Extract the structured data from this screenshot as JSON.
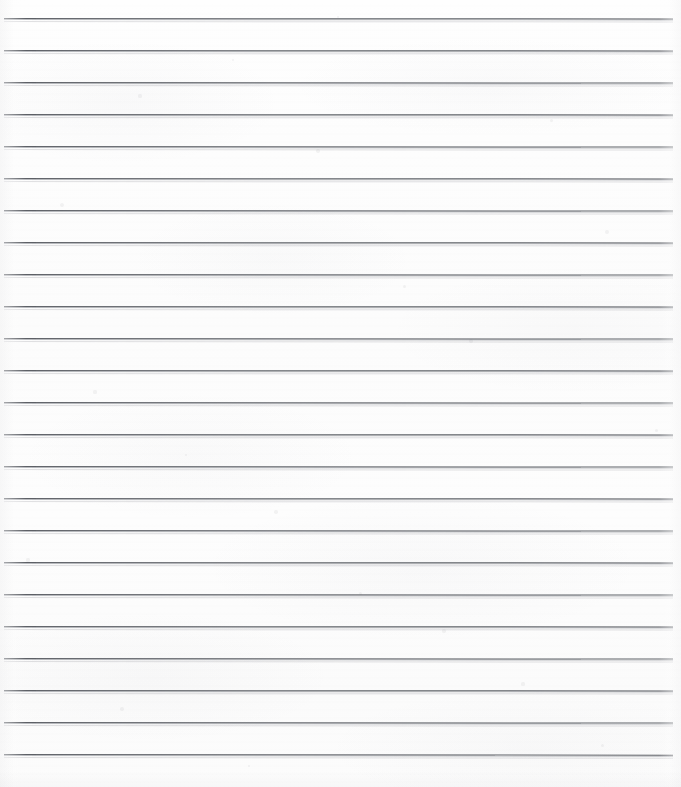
{
  "document": {
    "kind": "scanned-ruled-paper",
    "title": "Blank ruled notebook page",
    "content_text": "",
    "page_width": 681,
    "page_height": 787,
    "paper_color": "#fdfdfd",
    "rule_color": "#5d6066",
    "rule_shadow_color": "#8a8d94",
    "has_margin_rule": false,
    "has_handwriting": false,
    "has_printed_text": false
  },
  "ruling": {
    "line_count": 24,
    "pitch_px": 32,
    "first_line_y": 18,
    "last_line_y": 754,
    "line_start_x": 4,
    "line_end_x": 673,
    "thickness_px": 1,
    "lines": [
      {
        "index": 1,
        "y": 18,
        "x1": 4,
        "x2": 673,
        "tilt_deg": 0.04
      },
      {
        "index": 2,
        "y": 50,
        "x1": 4,
        "x2": 673,
        "tilt_deg": 0.04
      },
      {
        "index": 3,
        "y": 82,
        "x1": 4,
        "x2": 673,
        "tilt_deg": 0.05
      },
      {
        "index": 4,
        "y": 114,
        "x1": 4,
        "x2": 673,
        "tilt_deg": 0.04
      },
      {
        "index": 5,
        "y": 146,
        "x1": 4,
        "x2": 673,
        "tilt_deg": 0.05
      },
      {
        "index": 6,
        "y": 178,
        "x1": 4,
        "x2": 673,
        "tilt_deg": 0.04
      },
      {
        "index": 7,
        "y": 210,
        "x1": 4,
        "x2": 673,
        "tilt_deg": 0.05
      },
      {
        "index": 8,
        "y": 242,
        "x1": 4,
        "x2": 673,
        "tilt_deg": 0.04
      },
      {
        "index": 9,
        "y": 274,
        "x1": 4,
        "x2": 673,
        "tilt_deg": 0.05
      },
      {
        "index": 10,
        "y": 306,
        "x1": 4,
        "x2": 673,
        "tilt_deg": 0.04
      },
      {
        "index": 11,
        "y": 338,
        "x1": 4,
        "x2": 673,
        "tilt_deg": 0.05
      },
      {
        "index": 12,
        "y": 370,
        "x1": 4,
        "x2": 673,
        "tilt_deg": 0.04
      },
      {
        "index": 13,
        "y": 402,
        "x1": 4,
        "x2": 673,
        "tilt_deg": 0.05
      },
      {
        "index": 14,
        "y": 434,
        "x1": 4,
        "x2": 673,
        "tilt_deg": 0.04
      },
      {
        "index": 15,
        "y": 466,
        "x1": 4,
        "x2": 673,
        "tilt_deg": 0.05
      },
      {
        "index": 16,
        "y": 498,
        "x1": 4,
        "x2": 673,
        "tilt_deg": 0.04
      },
      {
        "index": 17,
        "y": 530,
        "x1": 4,
        "x2": 673,
        "tilt_deg": 0.05
      },
      {
        "index": 18,
        "y": 562,
        "x1": 4,
        "x2": 673,
        "tilt_deg": 0.04
      },
      {
        "index": 19,
        "y": 594,
        "x1": 4,
        "x2": 673,
        "tilt_deg": 0.05
      },
      {
        "index": 20,
        "y": 626,
        "x1": 4,
        "x2": 673,
        "tilt_deg": 0.04
      },
      {
        "index": 21,
        "y": 658,
        "x1": 4,
        "x2": 673,
        "tilt_deg": 0.05
      },
      {
        "index": 22,
        "y": 690,
        "x1": 4,
        "x2": 673,
        "tilt_deg": 0.04
      },
      {
        "index": 23,
        "y": 722,
        "x1": 4,
        "x2": 673,
        "tilt_deg": 0.05
      },
      {
        "index": 24,
        "y": 754,
        "x1": 4,
        "x2": 673,
        "tilt_deg": 0.06
      }
    ]
  },
  "artifacts": {
    "speckles": [
      {
        "x": 62,
        "y": 205,
        "r": 2.0
      },
      {
        "x": 140,
        "y": 96,
        "r": 1.6
      },
      {
        "x": 233,
        "y": 60,
        "r": 1.4
      },
      {
        "x": 318,
        "y": 151,
        "r": 1.8
      },
      {
        "x": 404,
        "y": 286,
        "r": 1.5
      },
      {
        "x": 471,
        "y": 341,
        "r": 1.7
      },
      {
        "x": 551,
        "y": 120,
        "r": 1.5
      },
      {
        "x": 607,
        "y": 232,
        "r": 1.9
      },
      {
        "x": 95,
        "y": 392,
        "r": 1.6
      },
      {
        "x": 186,
        "y": 455,
        "r": 1.4
      },
      {
        "x": 276,
        "y": 512,
        "r": 1.8
      },
      {
        "x": 360,
        "y": 593,
        "r": 1.5
      },
      {
        "x": 444,
        "y": 631,
        "r": 1.7
      },
      {
        "x": 523,
        "y": 684,
        "r": 1.6
      },
      {
        "x": 602,
        "y": 745,
        "r": 1.5
      },
      {
        "x": 122,
        "y": 709,
        "r": 1.8
      },
      {
        "x": 249,
        "y": 766,
        "r": 1.4
      },
      {
        "x": 656,
        "y": 430,
        "r": 1.5
      },
      {
        "x": 28,
        "y": 560,
        "r": 1.6
      },
      {
        "x": 338,
        "y": 17,
        "r": 1.3
      }
    ]
  }
}
